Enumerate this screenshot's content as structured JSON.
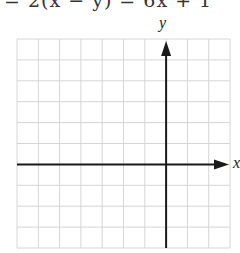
{
  "header": {
    "equation_clipped": "= 2(x − y) = 6x + 1"
  },
  "graph": {
    "x_axis_label": "x",
    "y_axis_label": "y",
    "columns": 10,
    "rows": 10,
    "cols_left_of_y_axis": 7,
    "rows_above_x_axis": 6,
    "grid_color": "#d6d6d6",
    "axis_color": "#1a1a1a"
  }
}
